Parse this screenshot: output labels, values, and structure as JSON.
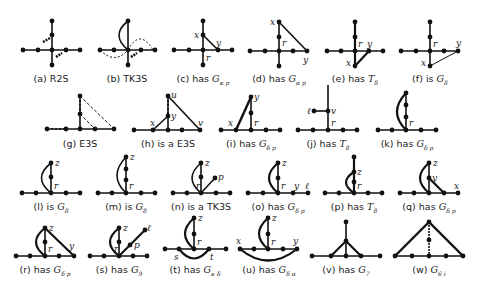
{
  "figure": {
    "panels": [
      {
        "id": "a",
        "tag": "(a)",
        "text": "R2S",
        "math": "",
        "sub": ""
      },
      {
        "id": "b",
        "tag": "(b)",
        "text": "TK3S",
        "math": "",
        "sub": ""
      },
      {
        "id": "c",
        "tag": "(c)",
        "text": "has",
        "math": "G",
        "sub": "κ p"
      },
      {
        "id": "d",
        "tag": "(d)",
        "text": "has",
        "math": "G",
        "sub": "α p"
      },
      {
        "id": "e",
        "tag": "(e)",
        "text": "has",
        "math": "T",
        "sub": "8"
      },
      {
        "id": "f",
        "tag": "(f)",
        "text": "is",
        "math": "G",
        "sub": "8"
      },
      {
        "id": "g",
        "tag": "(g)",
        "text": "E3S",
        "math": "",
        "sub": ""
      },
      {
        "id": "h",
        "tag": "(h)",
        "text": "is a E3S",
        "math": "",
        "sub": ""
      },
      {
        "id": "i",
        "tag": "(i)",
        "text": "has",
        "math": "G",
        "sub": "δ p"
      },
      {
        "id": "j",
        "tag": "(j)",
        "text": "has",
        "math": "T",
        "sub": "8"
      },
      {
        "id": "k",
        "tag": "(k)",
        "text": "has",
        "math": "G",
        "sub": "δ p"
      },
      {
        "id": "l",
        "tag": "(l)",
        "text": "is",
        "math": "G",
        "sub": "8"
      },
      {
        "id": "m",
        "tag": "(m)",
        "text": "is",
        "math": "G",
        "sub": "8"
      },
      {
        "id": "n",
        "tag": "(n)",
        "text": "is a TK3S",
        "math": "",
        "sub": ""
      },
      {
        "id": "o",
        "tag": "(o)",
        "text": "has",
        "math": "G",
        "sub": "δ p"
      },
      {
        "id": "p",
        "tag": "(p)",
        "text": "has",
        "math": "T",
        "sub": "8"
      },
      {
        "id": "q",
        "tag": "(q)",
        "text": "has",
        "math": "G",
        "sub": "δ p"
      },
      {
        "id": "r",
        "tag": "(r)",
        "text": "has",
        "math": "G",
        "sub": "δ p"
      },
      {
        "id": "s",
        "tag": "(s)",
        "text": "has",
        "math": "G",
        "sub": "9"
      },
      {
        "id": "t",
        "tag": "(t)",
        "text": "has",
        "math": "G",
        "sub": "κ δ"
      },
      {
        "id": "u",
        "tag": "(u)",
        "text": "has",
        "math": "G",
        "sub": "δ α"
      },
      {
        "id": "v",
        "tag": "(v)",
        "text": "has",
        "math": "G",
        "sub": "7"
      },
      {
        "id": "w",
        "tag": "(w)",
        "text": "",
        "math": "G",
        "sub": "6 i"
      }
    ],
    "vertex_labels": {
      "x": "x",
      "y": "y",
      "r": "r",
      "u": "u",
      "v": "v",
      "z": "z",
      "p": "p",
      "l": "ℓ",
      "s": "s",
      "t": "t"
    }
  }
}
